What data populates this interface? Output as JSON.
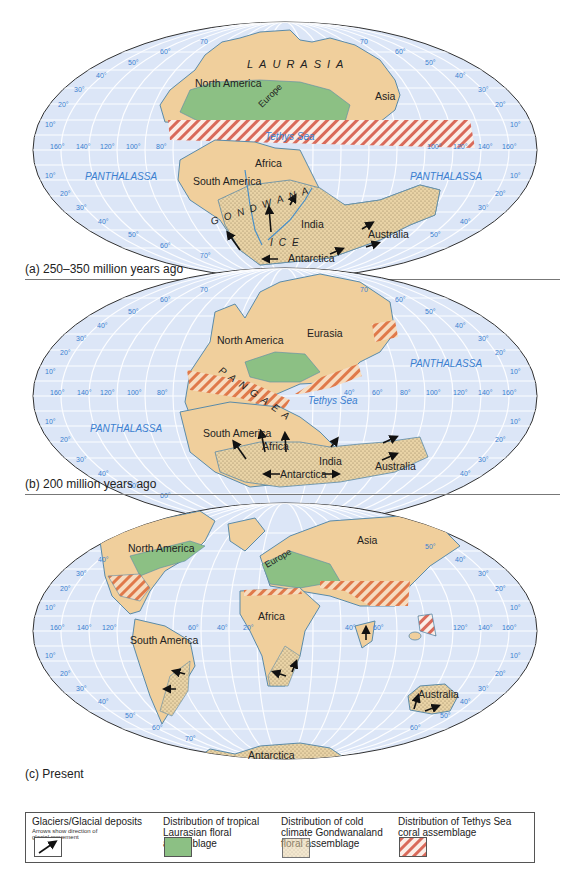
{
  "figure": {
    "background_color": "#ffffff",
    "ocean_color": "#dce6f7",
    "land_color": "#f0cf9c",
    "land_outline": "#5a8aa8",
    "grid_color": "#ffffff",
    "degree_label_color": "#3b7fd0",
    "laurasian_flora_color": "#8cc084",
    "gondwana_stipple_color": "#e8d4a8",
    "tethys_hatch_color": "#d96a5a"
  },
  "panels": [
    {
      "id": "a",
      "caption": "(a) 250–350 million years ago",
      "supercontinent_labels": [
        "LAURASIA",
        "GONDWANA"
      ],
      "continent_labels": [
        "North America",
        "Europe",
        "Asia",
        "Africa",
        "South America",
        "India",
        "Australia",
        "Antarctica"
      ],
      "ocean_labels": [
        "PANTHALASSA",
        "PANTHALASSA",
        "Tethys Sea"
      ],
      "ice_label": "ICE",
      "longitude_labels_left": [
        "160°",
        "140°",
        "120°",
        "100°",
        "80°"
      ],
      "longitude_labels_right": [
        "100°",
        "120°",
        "140°",
        "160°"
      ],
      "latitude_labels_north": [
        "10°",
        "20°",
        "30°",
        "40°",
        "50°",
        "60°",
        "70"
      ],
      "latitude_labels_south": [
        "10°",
        "20°",
        "30°",
        "40°",
        "50°",
        "60°",
        "70°"
      ]
    },
    {
      "id": "b",
      "caption": "(b) 200 million years ago",
      "supercontinent_labels": [
        "PANGAEA"
      ],
      "continent_labels": [
        "North America",
        "Eurasia",
        "South America",
        "Africa",
        "India",
        "Australia",
        "Antarctica"
      ],
      "ocean_labels": [
        "PANTHALASSA",
        "PANTHALASSA",
        "Tethys Sea"
      ],
      "longitude_labels_left": [
        "160°",
        "140°",
        "120°",
        "100°",
        "80°"
      ],
      "longitude_labels_right": [
        "40°",
        "60°",
        "80°",
        "100°",
        "120°",
        "140°",
        "160°"
      ],
      "latitude_labels_north": [
        "10°",
        "20°",
        "30°",
        "40°",
        "50°",
        "60°",
        "70"
      ],
      "latitude_labels_south": [
        "10°",
        "20°",
        "30°",
        "40°",
        "50°",
        "60°",
        "70°"
      ]
    },
    {
      "id": "c",
      "caption": "(c) Present",
      "continent_labels": [
        "North America",
        "Europe",
        "Asia",
        "Africa",
        "South America",
        "Australia",
        "Antarctica"
      ],
      "longitude_labels_left": [
        "160°",
        "140°",
        "120°",
        "60°",
        "40°",
        "20°"
      ],
      "longitude_labels_right": [
        "40°",
        "60°",
        "120°",
        "140°",
        "160°"
      ],
      "latitude_labels_north": [
        "10°",
        "20°",
        "30°",
        "40°",
        "50°"
      ],
      "latitude_labels_south": [
        "10°",
        "20°",
        "30°",
        "40°",
        "50°",
        "60°",
        "70°"
      ]
    }
  ],
  "legend": {
    "items": [
      {
        "title": "Glaciers/Glacial deposits",
        "subtitle": "Arrows show direction of glacial movement",
        "symbol": "arrow-icon"
      },
      {
        "title": "Distribution of tropical Laurasian floral assemblage",
        "symbol": "green-swatch"
      },
      {
        "title": "Distribution of cold climate Gondwanaland floral assemblage",
        "symbol": "stipple-swatch"
      },
      {
        "title": "Distribution of Tethys Sea coral assemblage",
        "symbol": "hatch-swatch"
      }
    ]
  }
}
